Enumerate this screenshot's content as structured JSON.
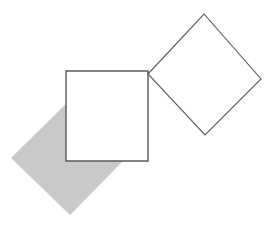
{
  "canvas": {
    "width": 279,
    "height": 230,
    "background_color": "#ffffff"
  },
  "figure": {
    "shape_count": 3
  },
  "shapes": [
    {
      "id": "gray-diamond",
      "name": "gray-filled-diamond",
      "kind": "diamond",
      "fill_color": "#c9c9c9",
      "stroke_color": "none",
      "stroke_width": 0,
      "points": "11,158 69,101 125,159 70,215",
      "vertices": {
        "left": [
          11,
          158
        ],
        "top": [
          69,
          101
        ],
        "right": [
          125,
          159
        ],
        "bottom": [
          70,
          215
        ]
      },
      "center": [
        68,
        158
      ],
      "rotation_deg": 45,
      "side_length": 81
    },
    {
      "id": "outlined-square",
      "name": "white-outlined-square",
      "kind": "square",
      "fill_color": "#ffffff",
      "stroke_color": "#595959",
      "stroke_width": 1.4,
      "points": "66,71 148,71 148,161 66,161",
      "vertices": {
        "top_left": [
          66,
          71
        ],
        "top_right": [
          148,
          71
        ],
        "bottom_right": [
          148,
          161
        ],
        "bottom_left": [
          66,
          161
        ]
      },
      "center": [
        107,
        116
      ],
      "rotation_deg": 0,
      "width": 82,
      "height": 90
    },
    {
      "id": "outlined-diamond",
      "name": "outlined-rotated-square",
      "kind": "diamond",
      "fill_color": "none",
      "stroke_color": "#5a5a5a",
      "stroke_width": 1.1,
      "points": "148,74 204,14 261,79 205,135",
      "vertices": {
        "left": [
          148,
          74
        ],
        "top": [
          204,
          14
        ],
        "right": [
          261,
          79
        ],
        "bottom": [
          205,
          135
        ]
      },
      "center": [
        204,
        74
      ],
      "rotation_deg": 45,
      "side_length": 82
    }
  ]
}
